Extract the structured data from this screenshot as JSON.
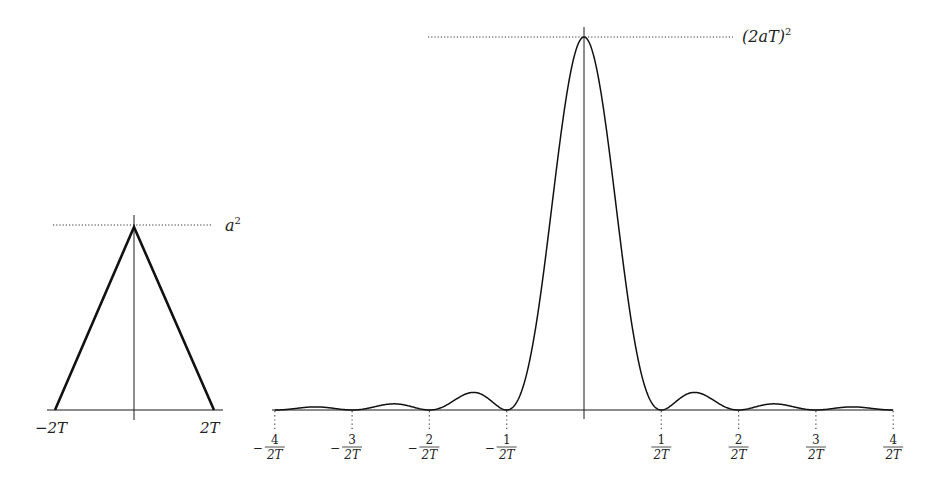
{
  "left_plot": {
    "title": "Triangle autocorrelation",
    "peak_label": "a",
    "peak_label_exp": "2",
    "x_labels": [
      "−2T",
      "2T"
    ],
    "x_values": [
      -2,
      2
    ],
    "peak_value": "a^2"
  },
  "right_plot": {
    "title": "sinc squared spectrum",
    "peak_label": "(2aT)",
    "peak_label_exp": "2",
    "tick_labels": [
      {
        "sign": "−",
        "num": "4",
        "den": "2T"
      },
      {
        "sign": "−",
        "num": "3",
        "den": "2T"
      },
      {
        "sign": "−",
        "num": "2",
        "den": "2T"
      },
      {
        "sign": "−",
        "num": "1",
        "den": "2T"
      },
      {
        "sign": "",
        "num": "1",
        "den": "2T"
      },
      {
        "sign": "",
        "num": "2",
        "den": "2T"
      },
      {
        "sign": "",
        "num": "3",
        "den": "2T"
      },
      {
        "sign": "",
        "num": "4",
        "den": "2T"
      }
    ]
  },
  "chart_data": [
    {
      "type": "line",
      "title": "",
      "xlabel": "",
      "ylabel": "",
      "x": [
        -2,
        0,
        2
      ],
      "series": [
        {
          "name": "triangle",
          "values": [
            0,
            1,
            0
          ]
        }
      ],
      "annotations": [
        "a^2 (peak, dotted guide)",
        "-2T",
        "2T"
      ],
      "grid": false
    },
    {
      "type": "line",
      "title": "",
      "xlabel": "",
      "ylabel": "",
      "function": "(2aT)^2 * sinc^2(2Tf)",
      "x_ticks": [
        -4,
        -3,
        -2,
        -1,
        1,
        2,
        3,
        4
      ],
      "x_tick_labels": [
        "-4/2T",
        "-3/2T",
        "-2/2T",
        "-1/2T",
        "1/2T",
        "2/2T",
        "3/2T",
        "4/2T"
      ],
      "xlim": [
        -4,
        4
      ],
      "ylim": [
        0,
        1
      ],
      "zeros_at": [
        -4,
        -3,
        -2,
        -1,
        1,
        2,
        3,
        4
      ],
      "peak": 1,
      "annotations": [
        "(2aT)^2 (peak, dotted guide)"
      ],
      "grid": false
    }
  ],
  "colors": {
    "line": "#1a1a1a",
    "text": "#222222",
    "background": "#ffffff"
  }
}
